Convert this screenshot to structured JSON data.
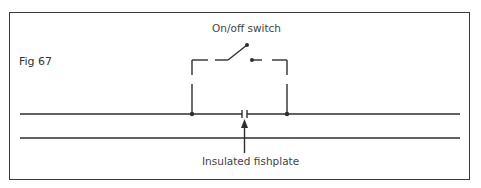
{
  "figure": {
    "label": "Fig 67",
    "switch_label": "On/off switch",
    "fishplate_label": "Insulated fishplate"
  },
  "colors": {
    "line": "#2e2e2e",
    "frame": "#3a3a3a",
    "background": "#ffffff"
  },
  "diagram": {
    "rails": [
      {
        "name": "upper-rail",
        "y": 114,
        "x1": 20,
        "x2": 460
      },
      {
        "name": "lower-rail",
        "y": 138,
        "x1": 20,
        "x2": 460
      }
    ],
    "fishplate_gap_x": [
      242,
      247
    ],
    "junctions": [
      {
        "x": 192,
        "y": 114
      },
      {
        "x": 287,
        "y": 114
      }
    ],
    "switch": {
      "pivot": [
        228,
        60
      ],
      "arm_end": [
        247,
        45
      ],
      "contact": [
        252,
        60
      ]
    }
  }
}
